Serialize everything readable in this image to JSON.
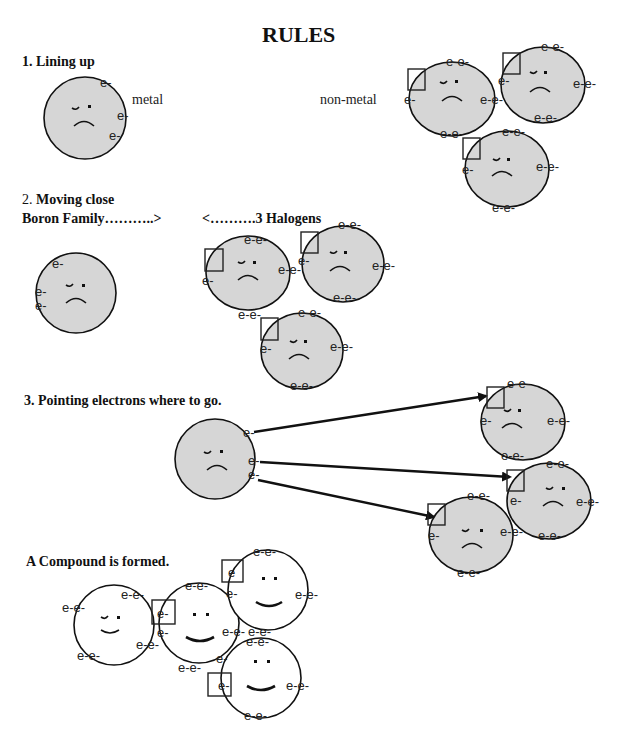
{
  "title": "RULES",
  "sections": [
    {
      "number": "1.",
      "heading": "Lining up",
      "labels": {
        "metal": "metal",
        "nonmetal": "non-metal"
      }
    },
    {
      "number": "2.",
      "heading": "Moving close",
      "left_label": "Boron Family………..>",
      "right_label": "<……….3 Halogens"
    },
    {
      "number": "3.",
      "heading": "Pointing electrons where to go."
    },
    {
      "heading": "A Compound is formed."
    }
  ],
  "electron": {
    "single": "e-",
    "pair": "e-e-",
    "bare": "e"
  },
  "colors": {
    "atom_fill": "#d6d6d6",
    "outline": "#111111",
    "background": "#ffffff"
  }
}
